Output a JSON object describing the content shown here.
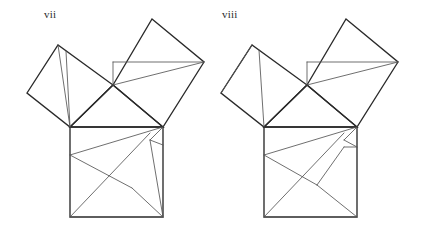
{
  "page": {
    "background_color": "#ffffff",
    "width": 423,
    "height": 241
  },
  "style": {
    "outline_color": "#2a2a2a",
    "inner_color": "#555555",
    "label_color": "#2b2b2b",
    "outline_width": 1.35,
    "inner_width": 0.85
  },
  "figures": [
    {
      "id": "vii",
      "label": "vii",
      "label_x": 44,
      "label_y": 8,
      "triangle": {
        "points": "70,127 163,127 113,85",
        "vertices": [
          [
            70,
            127
          ],
          [
            163,
            127
          ],
          [
            113,
            85
          ]
        ]
      },
      "squares": {
        "hypotenuse_square": {
          "name": "bottom-square",
          "points": "70,127 163,127 163,217 70,217"
        },
        "left_leg_square": {
          "name": "upper-left-square",
          "points": "70,127 113,85 58,45 27,93"
        },
        "right_leg_square": {
          "name": "upper-right-square",
          "points": "113,85 163,127 204,62 152,19"
        }
      },
      "inner_lines": [
        {
          "name": "ul-line-a",
          "x1": 58,
          "y1": 45,
          "x2": 70,
          "y2": 127
        },
        {
          "name": "ul-line-b",
          "x1": 66,
          "y1": 51,
          "x2": 70,
          "y2": 127
        },
        {
          "name": "ur-horizontal",
          "x1": 113,
          "y1": 62,
          "x2": 204,
          "y2": 62
        },
        {
          "name": "ur-vertical",
          "x1": 113,
          "y1": 62,
          "x2": 113,
          "y2": 85
        },
        {
          "name": "ur-diagonal",
          "x1": 113,
          "y1": 85,
          "x2": 204,
          "y2": 62
        },
        {
          "name": "bs-upper-left-diag",
          "x1": 70,
          "y1": 155,
          "x2": 163,
          "y2": 127
        },
        {
          "name": "bs-mid-diag",
          "x1": 70,
          "y1": 155,
          "x2": 132,
          "y2": 188
        },
        {
          "name": "bs-long-diag",
          "x1": 70,
          "y1": 217,
          "x2": 150,
          "y2": 133
        },
        {
          "name": "bs-right-diag",
          "x1": 132,
          "y1": 188,
          "x2": 163,
          "y2": 217
        },
        {
          "name": "bs-corner-notch-a",
          "x1": 163,
          "y1": 127,
          "x2": 150,
          "y2": 140
        },
        {
          "name": "bs-corner-notch-b",
          "x1": 150,
          "y1": 140,
          "x2": 163,
          "y2": 217
        },
        {
          "name": "bs-notch-edge",
          "x1": 150,
          "y1": 140,
          "x2": 163,
          "y2": 145
        }
      ]
    },
    {
      "id": "viii",
      "label": "viii",
      "label_x": 222,
      "label_y": 8,
      "triangle": {
        "points": "264,127 357,127 307,85",
        "vertices": [
          [
            264,
            127
          ],
          [
            357,
            127
          ],
          [
            307,
            85
          ]
        ]
      },
      "squares": {
        "hypotenuse_square": {
          "name": "bottom-square",
          "points": "264,127 357,127 357,217 264,217"
        },
        "left_leg_square": {
          "name": "upper-left-square",
          "points": "264,127 307,85 252,45 221,93"
        },
        "right_leg_square": {
          "name": "upper-right-square",
          "points": "307,85 357,127 398,62 346,19"
        }
      },
      "inner_lines": [
        {
          "name": "ul-diagonal",
          "x1": 221,
          "y1": 93,
          "x2": 252,
          "y2": 45
        },
        {
          "name": "ul-vertical",
          "x1": 264,
          "y1": 127,
          "x2": 259,
          "y2": 50
        },
        {
          "name": "ur-horizontal",
          "x1": 307,
          "y1": 62,
          "x2": 398,
          "y2": 62
        },
        {
          "name": "ur-vertical",
          "x1": 307,
          "y1": 62,
          "x2": 307,
          "y2": 85
        },
        {
          "name": "ur-diagonal",
          "x1": 307,
          "y1": 85,
          "x2": 398,
          "y2": 62
        },
        {
          "name": "bs-upper-left-diag",
          "x1": 264,
          "y1": 155,
          "x2": 357,
          "y2": 127
        },
        {
          "name": "bs-mid-diag",
          "x1": 264,
          "y1": 155,
          "x2": 317,
          "y2": 185
        },
        {
          "name": "bs-long-diag",
          "x1": 264,
          "y1": 217,
          "x2": 344,
          "y2": 133
        },
        {
          "name": "bs-right-diag",
          "x1": 317,
          "y1": 185,
          "x2": 357,
          "y2": 217
        },
        {
          "name": "bs-fan-a",
          "x1": 317,
          "y1": 185,
          "x2": 344,
          "y2": 147
        },
        {
          "name": "bs-corner-notch-a",
          "x1": 357,
          "y1": 127,
          "x2": 344,
          "y2": 140
        },
        {
          "name": "bs-corner-notch-b",
          "x1": 344,
          "y1": 140,
          "x2": 357,
          "y2": 147
        },
        {
          "name": "bs-corner-notch-c",
          "x1": 344,
          "y1": 147,
          "x2": 357,
          "y2": 147
        }
      ]
    }
  ]
}
